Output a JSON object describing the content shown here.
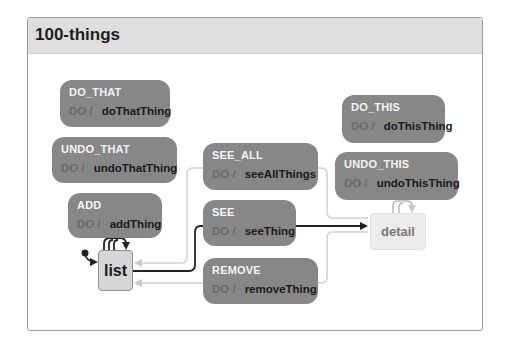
{
  "machine": {
    "title": "100-things"
  },
  "states": {
    "list": {
      "label": "list",
      "initial": true
    },
    "detail": {
      "label": "detail",
      "initial": false
    }
  },
  "events": [
    {
      "name": "DO_THAT",
      "do_label": "DO /",
      "action": "doThatThing",
      "from": "list",
      "to": "list"
    },
    {
      "name": "UNDO_THAT",
      "do_label": "DO /",
      "action": "undoThatThing",
      "from": "list",
      "to": "list"
    },
    {
      "name": "ADD",
      "do_label": "DO /",
      "action": "addThing",
      "from": "list",
      "to": "list"
    },
    {
      "name": "SEE_ALL",
      "do_label": "DO /",
      "action": "seeAllThings",
      "from": "detail",
      "to": "list"
    },
    {
      "name": "SEE",
      "do_label": "DO /",
      "action": "seeThing",
      "from": "list",
      "to": "detail"
    },
    {
      "name": "REMOVE",
      "do_label": "DO /",
      "action": "removeThing",
      "from": "detail",
      "to": "list"
    },
    {
      "name": "DO_THIS",
      "do_label": "DO /",
      "action": "doThisThing",
      "from": "detail",
      "to": "detail"
    },
    {
      "name": "UNDO_THIS",
      "do_label": "DO /",
      "action": "undoThisThing",
      "from": "detail",
      "to": "detail"
    }
  ],
  "colors": {
    "event_fill": "#878787",
    "active_edge": "#222222",
    "inactive_edge": "#cfcfcf",
    "header_fill": "#dedede"
  }
}
